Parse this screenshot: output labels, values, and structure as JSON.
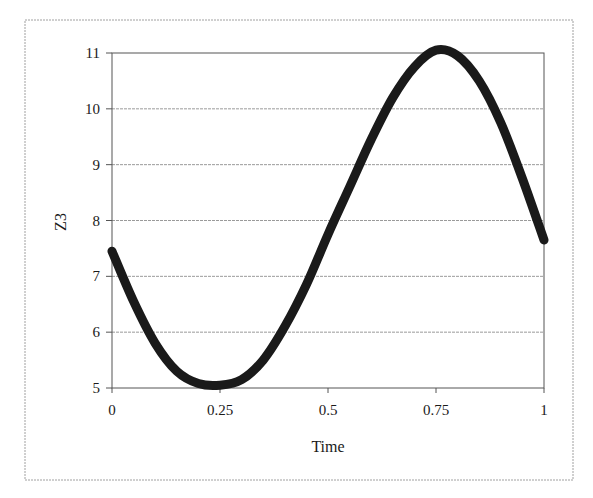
{
  "chart_data": {
    "type": "scatter",
    "title": "",
    "xlabel": "Time",
    "ylabel": "Z3",
    "xlim": [
      0,
      1
    ],
    "ylim": [
      5,
      11
    ],
    "x_ticks": [
      "0",
      "0.25",
      "0.5",
      "0.75",
      "1"
    ],
    "y_ticks": [
      "5",
      "6",
      "7",
      "8",
      "9",
      "10",
      "11"
    ],
    "grid": {
      "horizontal": true,
      "vertical": false
    },
    "legend": null,
    "marker": "dense black diamonds forming a thick line",
    "series": [
      {
        "name": "Z3",
        "x": [
          0,
          0.05,
          0.1,
          0.15,
          0.2,
          0.25,
          0.3,
          0.35,
          0.4,
          0.45,
          0.5,
          0.55,
          0.6,
          0.65,
          0.7,
          0.75,
          0.8,
          0.85,
          0.9,
          0.95,
          1
        ],
        "values": [
          7.45,
          6.55,
          5.8,
          5.3,
          5.08,
          5.05,
          5.15,
          5.5,
          6.1,
          6.85,
          7.75,
          8.6,
          9.45,
          10.2,
          10.75,
          11.05,
          10.95,
          10.5,
          9.75,
          8.75,
          7.65
        ]
      }
    ]
  },
  "colors": {
    "series": "#1a1a1a",
    "grid": "#9a9a9a",
    "frame": "#9a9a9a",
    "axis": "#555555"
  }
}
